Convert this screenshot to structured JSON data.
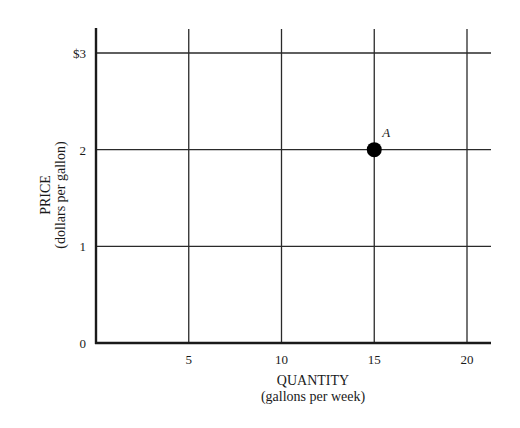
{
  "chart_data": {
    "type": "scatter",
    "title": "",
    "xlabel": "QUANTITY",
    "xlabel_sub": "(gallons per week)",
    "ylabel": "PRICE",
    "ylabel_sub": "(dollars per gallon)",
    "xlim": [
      0,
      21.3
    ],
    "ylim": [
      0,
      3.25
    ],
    "grid": true,
    "x_ticks": [
      5,
      10,
      15,
      20
    ],
    "x_tick_labels": [
      "5",
      "10",
      "15",
      "20"
    ],
    "y_ticks": [
      0,
      1,
      2,
      3
    ],
    "y_tick_labels": [
      "0",
      "1",
      "2",
      "$3"
    ],
    "points": [
      {
        "label": "A",
        "x": 15,
        "y": 2
      }
    ],
    "colors": {
      "line": "#1a1a1a",
      "grid": "#2a2a2a",
      "point": "#000000"
    }
  }
}
